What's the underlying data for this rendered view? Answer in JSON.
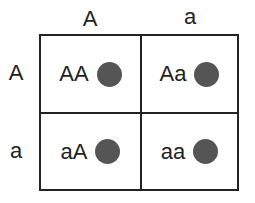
{
  "columns": [
    {
      "allele": "A"
    },
    {
      "allele": "a"
    }
  ],
  "rows": [
    {
      "allele": "A"
    },
    {
      "allele": "a"
    }
  ],
  "cells": [
    [
      {
        "genotype": "AA"
      },
      {
        "genotype": "Aa"
      }
    ],
    [
      {
        "genotype": "aA"
      },
      {
        "genotype": "aa"
      }
    ]
  ],
  "colors": {
    "dot": "#555555",
    "line": "#222222",
    "text": "#222222"
  }
}
